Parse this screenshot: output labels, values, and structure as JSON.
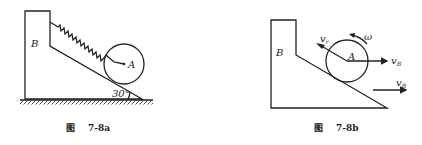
{
  "figures": [
    {
      "id": "fig-a",
      "caption_prefix": "图",
      "caption_number": "7-8a",
      "labels": {
        "block": "B",
        "disk": "A",
        "angle": "30°"
      }
    },
    {
      "id": "fig-b",
      "caption_prefix": "图",
      "caption_number": "7-8b",
      "labels": {
        "block": "B",
        "disk": "A",
        "omega": "ω",
        "vr_main": "v",
        "vr_sub": "r",
        "vB_center_main": "v",
        "vB_center_sub": "B",
        "vB_block_main": "v",
        "vB_block_sub": "B"
      }
    }
  ],
  "colors": {
    "stroke": "#222222",
    "background": "#ffffff"
  }
}
